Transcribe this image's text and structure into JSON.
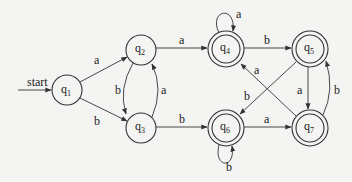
{
  "diagram": {
    "type": "finite-automaton",
    "start_label": "start",
    "states": [
      {
        "id": "q1",
        "name": "q",
        "sub": "1",
        "x": 67,
        "y": 90,
        "accepting": false,
        "start": true
      },
      {
        "id": "q2",
        "name": "q",
        "sub": "2",
        "x": 141,
        "y": 50,
        "accepting": false
      },
      {
        "id": "q3",
        "name": "q",
        "sub": "3",
        "x": 141,
        "y": 128,
        "accepting": false
      },
      {
        "id": "q4",
        "name": "q",
        "sub": "4",
        "x": 226,
        "y": 50,
        "accepting": true
      },
      {
        "id": "q5",
        "name": "q",
        "sub": "5",
        "x": 310,
        "y": 50,
        "accepting": true
      },
      {
        "id": "q6",
        "name": "q",
        "sub": "6",
        "x": 226,
        "y": 128,
        "accepting": true
      },
      {
        "id": "q7",
        "name": "q",
        "sub": "7",
        "x": 310,
        "y": 128,
        "accepting": true
      }
    ],
    "transitions": [
      {
        "from": "q1",
        "to": "q2",
        "label": "a"
      },
      {
        "from": "q1",
        "to": "q3",
        "label": "b"
      },
      {
        "from": "q2",
        "to": "q3",
        "label": "b"
      },
      {
        "from": "q3",
        "to": "q2",
        "label": "a"
      },
      {
        "from": "q2",
        "to": "q4",
        "label": "a"
      },
      {
        "from": "q3",
        "to": "q6",
        "label": "b"
      },
      {
        "from": "q4",
        "to": "q4",
        "label": "a"
      },
      {
        "from": "q4",
        "to": "q5",
        "label": "b"
      },
      {
        "from": "q5",
        "to": "q7",
        "label": "a"
      },
      {
        "from": "q7",
        "to": "q5",
        "label": "b"
      },
      {
        "from": "q5",
        "to": "q6",
        "label": "b"
      },
      {
        "from": "q7",
        "to": "q4",
        "label": "a"
      },
      {
        "from": "q6",
        "to": "q6",
        "label": "b"
      },
      {
        "from": "q6",
        "to": "q7",
        "label": "a"
      }
    ]
  }
}
